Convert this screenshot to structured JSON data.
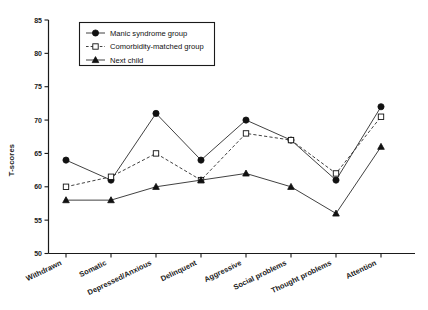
{
  "chart_data": {
    "type": "line",
    "title": "",
    "xlabel": "",
    "ylabel": "T-scores",
    "ylim": [
      50,
      85
    ],
    "yticks": [
      50,
      55,
      60,
      65,
      70,
      75,
      80,
      85
    ],
    "grid": false,
    "legend_position": "top-left-inside",
    "categories": [
      "Withdrawn",
      "Somatic",
      "Depressed/Anxious",
      "Delinquent",
      "Aggressive",
      "Social problems",
      "Thought problems",
      "Attention"
    ],
    "series": [
      {
        "name": "Manic syndrome group",
        "marker": "filled-circle",
        "line": "solid",
        "values": [
          64,
          61,
          71,
          64,
          70,
          67,
          61,
          72
        ]
      },
      {
        "name": "Comorbidity-matched group",
        "marker": "open-square",
        "line": "dashed",
        "values": [
          60,
          61.5,
          65,
          61,
          68,
          67,
          62,
          70.5
        ]
      },
      {
        "name": "Next child",
        "marker": "filled-triangle",
        "line": "solid",
        "values": [
          58,
          58,
          60,
          61,
          62,
          60,
          56,
          66
        ]
      }
    ]
  },
  "legend": {
    "items": [
      {
        "label": "Manic syndrome group",
        "marker": "filled-circle",
        "line": "solid"
      },
      {
        "label": "Comorbidity-matched group",
        "marker": "open-square",
        "line": "dashed"
      },
      {
        "label": "Next child",
        "marker": "filled-triangle",
        "line": "solid"
      }
    ]
  },
  "colors": {
    "ink": "#111111",
    "line": "#2b2b2b",
    "background": "#ffffff"
  }
}
